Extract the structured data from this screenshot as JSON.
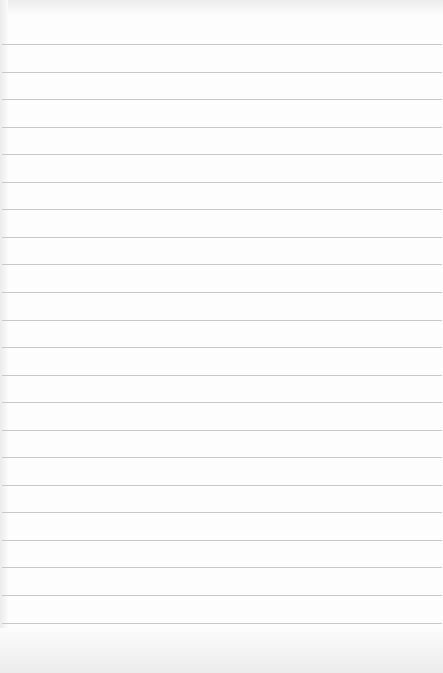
{
  "paper": {
    "kind": "lined notepad page",
    "background_color": "#fdfdfd",
    "rule_color": "#c8c8c8",
    "rule_count": 22,
    "first_rule_y": 44,
    "rule_spacing": 27.55,
    "content": ""
  }
}
